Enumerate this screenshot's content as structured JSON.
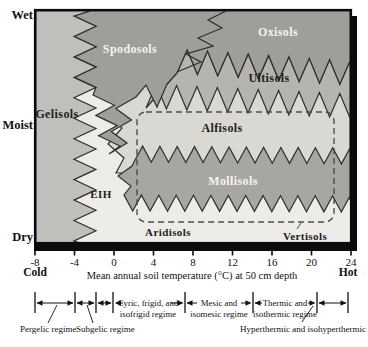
{
  "figure": {
    "regions": {
      "spodosols": "Spodosols",
      "oxisols": "Oxisols",
      "ultisols": "Ultisols",
      "gelisols": "Gelisols",
      "alfisols": "Alfisols",
      "mollisols": "Mollisols",
      "eih": "EIH",
      "aridisols": "Aridisols",
      "vertisols": "Vertisols"
    },
    "y_axis": {
      "wet": "Wet",
      "moist": "Moist",
      "dry": "Dry"
    },
    "x_axis": {
      "ticks": [
        "-8",
        "-4",
        "0",
        "4",
        "8",
        "12",
        "16",
        "20",
        "24"
      ],
      "cold": "Cold",
      "hot": "Hot",
      "title": "Mean annual soil temperature (°C) at 50 cm depth"
    },
    "regime_scale": {
      "pergelic": "Pergelic regime",
      "subgelic": "Subgelic regime",
      "cryic_l1": "Cyric, frigid, and",
      "cryic_l2": "isofrigid regime",
      "mesic_l1": "Mesic and",
      "mesic_l2": "isomesic regime",
      "thermic_l1": "Thermic and",
      "thermic_l2": "isothermic regime",
      "hyperthermic": "Hyperthermic and isohyperthermic"
    }
  },
  "colors": {
    "spodosols_oxisols": "#9f9e9a",
    "ultisols": "#b5b4b0",
    "gelisols": "#c0bfbb",
    "alfisols": "#d9d8d3",
    "mollisols": "#a7a6a2",
    "light_zone": "#edece8",
    "boundary_line": "#2e2e2e",
    "dashed_line": "#4d4d4d",
    "axis_black": "#0b0b0b"
  }
}
